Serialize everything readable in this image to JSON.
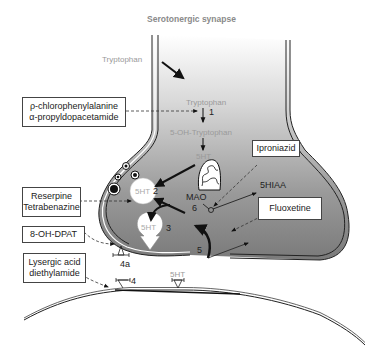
{
  "title": "Serotonergic synapse",
  "labels": {
    "tryptophan_outside": "Tryptophan",
    "tryptophan_inside": "Tryptophan",
    "five_oh_tryptophan": "5-OH-Tryptophan",
    "fiveht_cyto": "5HT",
    "fiveht_vesicle": "5HT",
    "fiveht_release": "5HT",
    "fiveht_receptor": "5HT",
    "mao": "MAO",
    "fivehiaa": "5HIAA"
  },
  "step_numbers": {
    "s1": "1",
    "s2": "2",
    "s3": "3",
    "s4": "4",
    "s4a": "4a",
    "s5": "5",
    "s6": "6"
  },
  "drug_boxes": {
    "pcpa": [
      "ρ-chlorophenylalanine",
      "α-propyldopacetamide"
    ],
    "reserpine": [
      "Reserpine",
      "Tetrabenazine"
    ],
    "dpat": [
      "8-OH-DPAT"
    ],
    "lsd": [
      "Lysergic acid",
      "diethylamide"
    ],
    "iproniazid": [
      "Iproniazid"
    ],
    "fluoxetine": [
      "Fluoxetine"
    ]
  },
  "colors": {
    "terminal_fill_top": "#f4f4f4",
    "terminal_fill_bottom": "#8c8c8c",
    "line": "#222222",
    "label_gray": "#9a9a9a"
  }
}
